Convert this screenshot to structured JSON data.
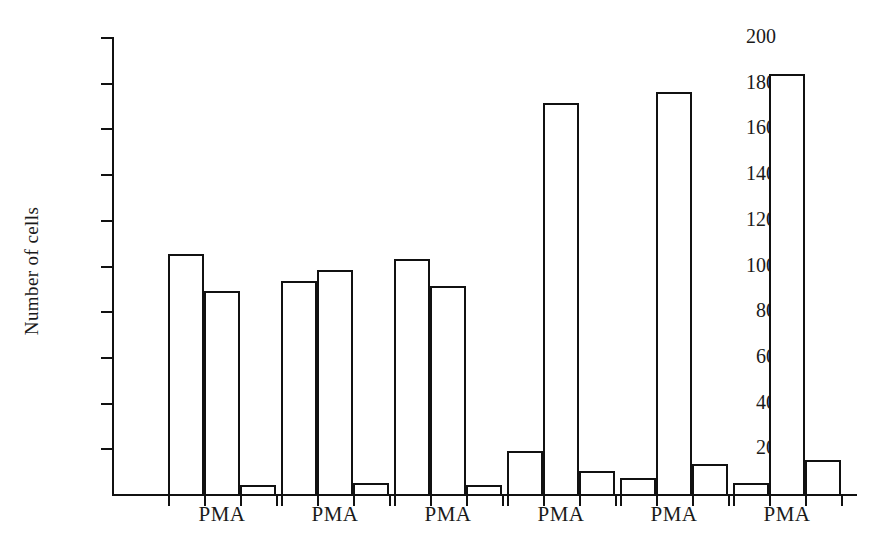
{
  "chart_data": {
    "type": "bar",
    "title": "",
    "xlabel": "",
    "ylabel": "Number of cells",
    "ylim": [
      0,
      200
    ],
    "yticks": [
      20,
      40,
      60,
      80,
      100,
      120,
      140,
      160,
      180,
      200
    ],
    "grid": false,
    "legend": null,
    "bar_style": "open rectangles, white fill, black outline",
    "categories": [
      "PMA",
      "PMA",
      "PMA",
      "PMA",
      "PMA",
      "PMA"
    ],
    "series": [
      {
        "name": "bar 1",
        "values": [
          105,
          93,
          103,
          19,
          7,
          5
        ]
      },
      {
        "name": "bar 2",
        "values": [
          89,
          98,
          91,
          171,
          176,
          184
        ]
      },
      {
        "name": "bar 3",
        "values": [
          4,
          5,
          4,
          10,
          13,
          15
        ]
      }
    ],
    "groups": [
      {
        "label": "PMA",
        "values": [
          105,
          89,
          4
        ]
      },
      {
        "label": "PMA",
        "values": [
          93,
          98,
          5
        ]
      },
      {
        "label": "PMA",
        "values": [
          103,
          91,
          4
        ]
      },
      {
        "label": "PMA",
        "values": [
          19,
          171,
          10
        ]
      },
      {
        "label": "PMA",
        "values": [
          7,
          176,
          13
        ]
      },
      {
        "label": "PMA",
        "values": [
          5,
          184,
          15
        ]
      }
    ],
    "annotations": []
  },
  "axes": {
    "y_tick_labels": [
      "200",
      "180",
      "160",
      "140",
      "120",
      "100",
      "80",
      "60",
      "40",
      "20"
    ],
    "y_axis_title": "Number of cells",
    "x_tick_labels": [
      "PMA",
      "PMA",
      "PMA",
      "PMA",
      "PMA",
      "PMA"
    ]
  },
  "colors": {
    "ink": "#111111",
    "bar_fill": "#ffffff",
    "background": "#ffffff"
  }
}
